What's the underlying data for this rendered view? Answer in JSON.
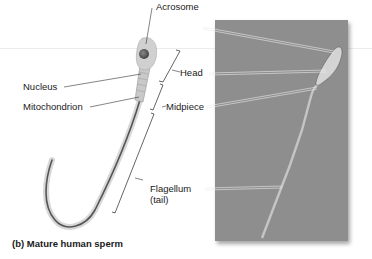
{
  "figure": {
    "caption": "(b) Mature human sperm",
    "labels": {
      "acrosome": "Acrosome",
      "nucleus": "Nucleus",
      "mitochondrion": "Mitochondrion",
      "head": "Head",
      "midpiece": "Midpiece",
      "flagellum": "Flagellum",
      "flagellum_sub": "(tail)"
    },
    "colors": {
      "photo_bg": "#8e8e8e",
      "sperm_drawing": "#b8b8b8",
      "leader_line": "#333333"
    }
  }
}
